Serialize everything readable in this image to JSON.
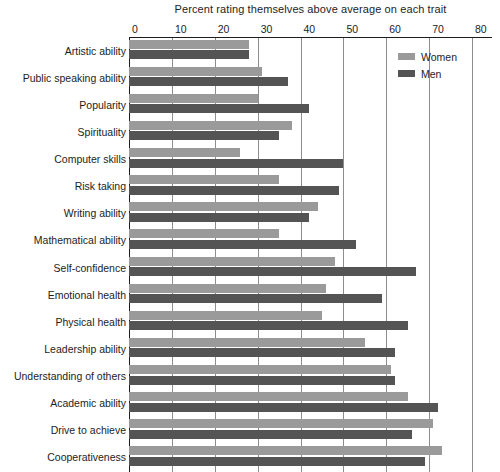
{
  "chart_data": {
    "type": "bar",
    "orientation": "horizontal",
    "title": "Percent rating themselves above average on each trait",
    "xlabel": "",
    "ylabel": "",
    "xlim": [
      0,
      80
    ],
    "xticks": [
      0,
      10,
      20,
      30,
      40,
      50,
      60,
      70,
      80
    ],
    "grid": true,
    "legend_position": "top-right",
    "categories": [
      "Artistic ability",
      "Public speaking ability",
      "Popularity",
      "Spirituality",
      "Computer skills",
      "Risk taking",
      "Writing ability",
      "Mathematical ability",
      "Self-confidence",
      "Emotional health",
      "Physical health",
      "Leadership ability",
      "Understanding of others",
      "Academic ability",
      "Drive to achieve",
      "Cooperativeness"
    ],
    "series": [
      {
        "name": "Women",
        "color": "#9a9a9a",
        "values": [
          28,
          31,
          30,
          38,
          26,
          35,
          44,
          35,
          48,
          46,
          45,
          55,
          61,
          65,
          71,
          73
        ]
      },
      {
        "name": "Men",
        "color": "#545454",
        "values": [
          28,
          37,
          42,
          35,
          50,
          49,
          42,
          53,
          67,
          59,
          65,
          62,
          62,
          72,
          66,
          69
        ]
      }
    ]
  },
  "legend": {
    "items": [
      {
        "label": "Women",
        "swatch": "women"
      },
      {
        "label": "Men",
        "swatch": "men"
      }
    ]
  }
}
